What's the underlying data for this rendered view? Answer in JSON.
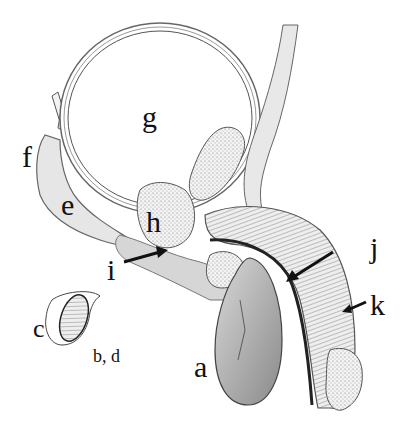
{
  "figure": {
    "labels": [
      {
        "id": "a",
        "text": "a"
      },
      {
        "id": "bd",
        "text": "b, d"
      },
      {
        "id": "c",
        "text": "c"
      },
      {
        "id": "e",
        "text": "e"
      },
      {
        "id": "f",
        "text": "f"
      },
      {
        "id": "g",
        "text": "g"
      },
      {
        "id": "h",
        "text": "h"
      },
      {
        "id": "i",
        "text": "i"
      },
      {
        "id": "j",
        "text": "j"
      },
      {
        "id": "k",
        "text": "k"
      }
    ]
  }
}
